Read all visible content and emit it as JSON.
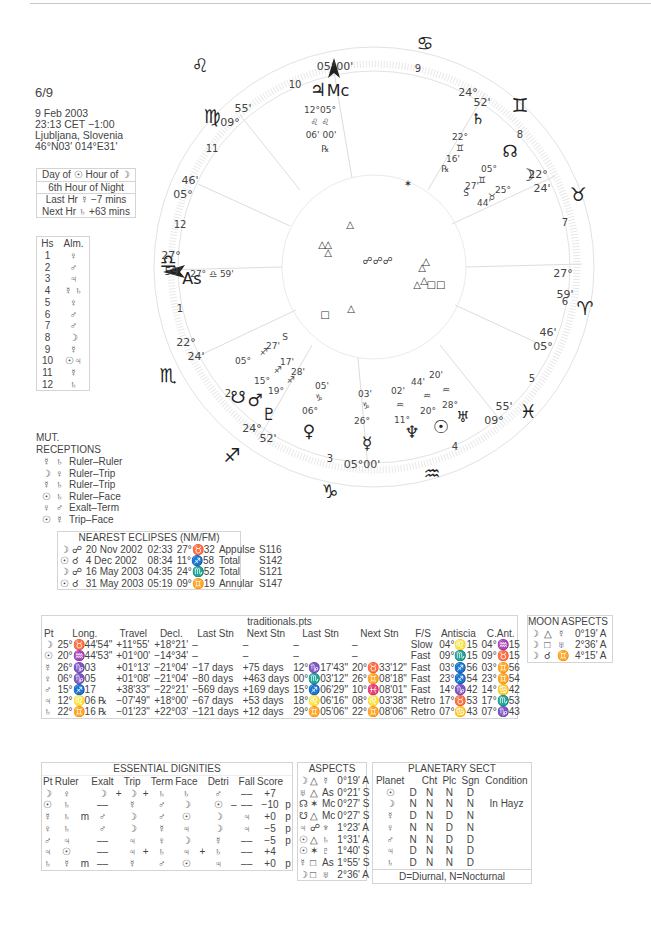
{
  "header": {
    "chart_id": "6/9",
    "date": "9 Feb 2003",
    "time": "23:13  CET −1:00",
    "place": "Ljubljana, Slovenia",
    "coords": "46°N03' 014°E31'"
  },
  "planetary_hours": {
    "line1": "Day of ☉  Hour of ☽",
    "line2": "6th Hour of Night",
    "line3": "Last Hr  ☿  −7 mins",
    "line4": "Next Hr  ♄  +63 mins"
  },
  "houses_almutens": {
    "headers": [
      "Hs",
      "Alm."
    ],
    "rows": [
      [
        "1",
        "♀"
      ],
      [
        "2",
        "♂"
      ],
      [
        "3",
        "♃"
      ],
      [
        "4",
        "☿ ♄"
      ],
      [
        "5",
        "♀"
      ],
      [
        "6",
        "♂"
      ],
      [
        "7",
        "♂"
      ],
      [
        "8",
        "☽"
      ],
      [
        "9",
        "☿"
      ],
      [
        "10",
        "☉♃"
      ],
      [
        "11",
        "☿"
      ],
      [
        "12",
        "♄"
      ]
    ]
  },
  "mutual_receptions": {
    "title": "MUT. RECEPTIONS",
    "rows": [
      {
        "p1": "☿",
        "p2": "♄",
        "type": "Ruler–Ruler"
      },
      {
        "p1": "☽",
        "p2": "♀",
        "type": "Ruler–Trip"
      },
      {
        "p1": "☿",
        "p2": "♄",
        "type": "Ruler–Trip"
      },
      {
        "p1": "☉",
        "p2": "♄",
        "type": "Ruler–Face"
      },
      {
        "p1": "♀",
        "p2": "♂",
        "type": "Exalt–Term"
      },
      {
        "p1": "☉",
        "p2": "☿",
        "type": "Trip–Face"
      }
    ]
  },
  "eclipses": {
    "title": "NEAREST ECLIPSES (NM/FM)",
    "rows": [
      [
        "☽ ☍",
        "20 Nov 2002",
        "02:33",
        "27°♉32",
        "Appulse",
        "S116"
      ],
      [
        "☉ ☌",
        "4 Dec 2002",
        "08:34",
        "11°♐58",
        "Total",
        "S142"
      ],
      [
        "☽ ☍",
        "16 May 2003",
        "04:35",
        "24°♏52",
        "Total",
        "S121"
      ],
      [
        "☉ ☌",
        "31 May 2003",
        "05:19",
        "09°♊19",
        "Annular",
        "S147"
      ]
    ]
  },
  "traditionals": {
    "title": "traditionals.pts",
    "headers": [
      "Pt",
      "Long.",
      "Travel",
      "Decl.",
      "Last Stn",
      "Next Stn",
      "Last Stn",
      "Next Stn",
      "F/S",
      "Antiscia",
      "C.Ant."
    ],
    "rows": [
      [
        "☽",
        "25°♉44'54\"",
        "+11°55'",
        "+18°21'",
        "–",
        "–",
        "–",
        "–",
        "Slow",
        "04°♌15",
        "04°♒15"
      ],
      [
        "☉",
        "20°♒44'53\"",
        "+01°00'",
        "−14°34'",
        "–",
        "–",
        "–",
        "–",
        "Fast",
        "09°♏15",
        "09°♉15"
      ],
      [
        "☿",
        "26°♑03",
        "+01°13'",
        "−21°04'",
        "−17 days",
        "+75 days",
        "12°♑17'43\"",
        "20°♉33'12\"",
        "Fast",
        "03°♐56",
        "03°♊56"
      ],
      [
        "♀",
        "06°♑05",
        "+01°08'",
        "−21°04'",
        "−80 days",
        "+463 days",
        "00°♏03'12\"",
        "26°♊08'18\"",
        "Fast",
        "23°♐54",
        "23°♊54"
      ],
      [
        "♂",
        "15°♐17",
        "+38'33\"",
        "−22°21'",
        "−569 days",
        "+169 days",
        "15°♐06'29\"",
        "10°♓08'01\"",
        "Fast",
        "14°♑42",
        "14°♋42"
      ],
      [
        "♃",
        "12°♌06 ℞",
        "−07'49\"",
        "+18°00'",
        "−67 days",
        "+53 days",
        "18°♌06'16\"",
        "08°♌03'38\"",
        "Retro",
        "17°♉53",
        "17°♏53"
      ],
      [
        "♄",
        "22°♊16 ℞",
        "−01'23\"",
        "+22°03'",
        "−121 days",
        "+12 days",
        "29°♊05'06\"",
        "22°♊08'06\"",
        "Retro",
        "07°♋43",
        "07°♑43"
      ]
    ]
  },
  "moon_aspects": {
    "title": "MOON ASPECTS",
    "rows": [
      [
        "☽",
        "△",
        "☿",
        "0°19' A"
      ],
      [
        "☽",
        "□",
        "♅",
        "2°36' A"
      ],
      [
        "☽",
        "☌",
        "♊",
        "4°15' A"
      ]
    ]
  },
  "essential_dignities": {
    "title": "ESSENTIAL DIGNITIES",
    "headers": [
      "Pt",
      "Ruler",
      "",
      "Exalt",
      "",
      "Trip",
      "",
      "Term",
      "Face",
      "",
      "Detri",
      "",
      "Fall",
      "Score",
      ""
    ],
    "rows": [
      [
        "☽",
        "♀",
        "",
        "☽",
        "+",
        "☽",
        "+",
        "♄",
        "♄",
        "",
        "♂",
        "",
        "––",
        "+7",
        ""
      ],
      [
        "☉",
        "♄",
        "",
        "––",
        "",
        "☿",
        "",
        "♂",
        "☽",
        "",
        "☉",
        "–",
        "––",
        "−10",
        "p"
      ],
      [
        "☿",
        "♄",
        "m",
        "♂",
        "",
        "☽",
        "",
        "♂",
        "☉",
        "",
        "☽",
        "",
        "♃",
        "+0",
        "p"
      ],
      [
        "♀",
        "♄",
        "",
        "♂",
        "",
        "☽",
        "",
        "☿",
        "♃",
        "",
        "☽",
        "",
        "♃",
        "−5",
        "p"
      ],
      [
        "♂",
        "♃",
        "",
        "––",
        "",
        "♃",
        "",
        "♀",
        "☽",
        "",
        "☿",
        "",
        "––",
        "−5",
        "p"
      ],
      [
        "♃",
        "☉",
        "",
        "––",
        "",
        "♃",
        "+",
        "♄",
        "♃",
        "+",
        "♄",
        "",
        "––",
        "+4",
        ""
      ],
      [
        "♄",
        "☿",
        "m",
        "––",
        "",
        "☿",
        "",
        "♂",
        "☉",
        "",
        "♃",
        "",
        "––",
        "+0",
        "p"
      ]
    ]
  },
  "aspects": {
    "title": "ASPECTS",
    "rows": [
      [
        "☽",
        "△",
        "☿",
        "0°19' A"
      ],
      [
        "♅",
        "△",
        "As",
        "0°21' S"
      ],
      [
        "☊",
        "✶",
        "Mc",
        "0°27' S"
      ],
      [
        "☋",
        "△",
        "Mc",
        "0°27' S"
      ],
      [
        "♃",
        "☍",
        "♆",
        "1°23' A"
      ],
      [
        "☉",
        "△",
        "♄",
        "1°31' A"
      ],
      [
        "☉",
        "✶",
        "♇",
        "1°40' S"
      ],
      [
        "☿",
        "□",
        "As",
        "1°55' S"
      ],
      [
        "☽",
        "□",
        "♅",
        "2°36' A"
      ]
    ]
  },
  "planetary_sect": {
    "title": "PLANETARY SECT",
    "headers": [
      "Planet",
      "",
      "Cht",
      "Plc",
      "Sgn",
      "Condition"
    ],
    "rows": [
      [
        "☉",
        "D",
        "N",
        "N",
        "D",
        ""
      ],
      [
        "☽",
        "N",
        "N",
        "N",
        "N",
        "In Hayz"
      ],
      [
        "☿",
        "D",
        "N",
        "D",
        "N",
        ""
      ],
      [
        "♀",
        "N",
        "N",
        "D",
        "N",
        ""
      ],
      [
        "♂",
        "N",
        "N",
        "D",
        "D",
        ""
      ],
      [
        "♃",
        "D",
        "N",
        "N",
        "D",
        ""
      ],
      [
        "♄",
        "D",
        "N",
        "N",
        "D",
        ""
      ]
    ],
    "footer": "D=Diurnal, N=Nocturnal"
  },
  "wheel": {
    "signs": [
      {
        "glyph": "♌",
        "x": 200,
        "y": 72
      },
      {
        "glyph": "♋",
        "x": 425,
        "y": 50
      },
      {
        "glyph": "♊",
        "x": 520,
        "y": 112
      },
      {
        "glyph": "♉",
        "x": 578,
        "y": 201
      },
      {
        "glyph": "♈",
        "x": 585,
        "y": 315
      },
      {
        "glyph": "♓",
        "x": 528,
        "y": 418
      },
      {
        "glyph": "♒",
        "x": 432,
        "y": 480
      },
      {
        "glyph": "♑",
        "x": 330,
        "y": 498
      },
      {
        "glyph": "♐",
        "x": 232,
        "y": 462
      },
      {
        "glyph": "♏",
        "x": 168,
        "y": 382
      },
      {
        "glyph": "♎",
        "x": 168,
        "y": 268
      },
      {
        "glyph": "♍",
        "x": 212,
        "y": 123
      }
    ],
    "house_numbers": [
      {
        "n": "1",
        "x": 180,
        "y": 312
      },
      {
        "n": "2",
        "x": 228,
        "y": 397
      },
      {
        "n": "3",
        "x": 330,
        "y": 462
      },
      {
        "n": "4",
        "x": 455,
        "y": 450
      },
      {
        "n": "5",
        "x": 532,
        "y": 382
      },
      {
        "n": "6",
        "x": 565,
        "y": 305
      },
      {
        "n": "7",
        "x": 565,
        "y": 226
      },
      {
        "n": "8",
        "x": 520,
        "y": 138
      },
      {
        "n": "9",
        "x": 418,
        "y": 72
      },
      {
        "n": "10",
        "x": 295,
        "y": 88
      },
      {
        "n": "11",
        "x": 212,
        "y": 152
      },
      {
        "n": "12",
        "x": 180,
        "y": 228
      }
    ],
    "cusp_labels": [
      {
        "t": "05°00'",
        "x": 335,
        "y": 70
      },
      {
        "t": "24°",
        "x": 468,
        "y": 96
      },
      {
        "t": "52'",
        "x": 482,
        "y": 106
      },
      {
        "t": "22°",
        "x": 538,
        "y": 178
      },
      {
        "t": "24'",
        "x": 542,
        "y": 192
      },
      {
        "t": "27°",
        "x": 563,
        "y": 277
      },
      {
        "t": "59'",
        "x": 565,
        "y": 298
      },
      {
        "t": "46'",
        "x": 548,
        "y": 336
      },
      {
        "t": "05°",
        "x": 543,
        "y": 350
      },
      {
        "t": "55'",
        "x": 504,
        "y": 410
      },
      {
        "t": "09°",
        "x": 494,
        "y": 424
      },
      {
        "t": "05°00'",
        "x": 362,
        "y": 468
      },
      {
        "t": "24°",
        "x": 252,
        "y": 432
      },
      {
        "t": "52'",
        "x": 268,
        "y": 442
      },
      {
        "t": "22°",
        "x": 186,
        "y": 346
      },
      {
        "t": "24'",
        "x": 196,
        "y": 360
      },
      {
        "t": "27°",
        "x": 171,
        "y": 259
      },
      {
        "t": "59'",
        "x": 173,
        "y": 275
      },
      {
        "t": "46'",
        "x": 190,
        "y": 184
      },
      {
        "t": "05°",
        "x": 183,
        "y": 198
      },
      {
        "t": "55'",
        "x": 243,
        "y": 112
      },
      {
        "t": "09°",
        "x": 230,
        "y": 126
      }
    ],
    "planets": [
      {
        "glyph": "♃",
        "x": 318,
        "y": 96,
        "size": 18
      },
      {
        "glyph": "Mc",
        "x": 338,
        "y": 96,
        "size": 16
      },
      {
        "glyph": "♄",
        "x": 478,
        "y": 124,
        "size": 15
      },
      {
        "glyph": "☊",
        "x": 510,
        "y": 157,
        "size": 17
      },
      {
        "glyph": "☽",
        "x": 527,
        "y": 181,
        "size": 17
      },
      {
        "glyph": "As",
        "x": 192,
        "y": 284,
        "size": 16
      },
      {
        "glyph": "☋",
        "x": 238,
        "y": 403,
        "size": 17
      },
      {
        "glyph": "♂",
        "x": 255,
        "y": 406,
        "size": 17
      },
      {
        "glyph": "♇",
        "x": 269,
        "y": 420,
        "size": 17
      },
      {
        "glyph": "♀",
        "x": 309,
        "y": 437,
        "size": 17
      },
      {
        "glyph": "☿",
        "x": 367,
        "y": 449,
        "size": 17
      },
      {
        "glyph": "♆",
        "x": 412,
        "y": 438,
        "size": 17
      },
      {
        "glyph": "☉",
        "x": 441,
        "y": 433,
        "size": 18
      },
      {
        "glyph": "♅",
        "x": 463,
        "y": 422,
        "size": 15
      }
    ],
    "planet_labels": [
      {
        "t": "12°05°",
        "x": 320,
        "y": 113
      },
      {
        "t": "♌ ♌",
        "x": 320,
        "y": 125
      },
      {
        "t": "06' 00'",
        "x": 321,
        "y": 138
      },
      {
        "t": "℞",
        "x": 325,
        "y": 152
      },
      {
        "t": "22°",
        "x": 460,
        "y": 140
      },
      {
        "t": "♊",
        "x": 460,
        "y": 151
      },
      {
        "t": "16'",
        "x": 453,
        "y": 162
      },
      {
        "t": "℞",
        "x": 445,
        "y": 172
      },
      {
        "t": "05°",
        "x": 489,
        "y": 172
      },
      {
        "t": "♊",
        "x": 482,
        "y": 183
      },
      {
        "t": "27'",
        "x": 472,
        "y": 189
      },
      {
        "t": "S",
        "x": 466,
        "y": 196
      },
      {
        "t": "25°",
        "x": 503,
        "y": 193
      },
      {
        "t": "♉",
        "x": 492,
        "y": 200
      },
      {
        "t": "44'",
        "x": 484,
        "y": 206
      },
      {
        "t": "27° ♎ 59'",
        "x": 212,
        "y": 277
      },
      {
        "t": "S",
        "x": 285,
        "y": 340
      },
      {
        "t": "27'",
        "x": 273,
        "y": 349
      },
      {
        "t": "♐",
        "x": 264,
        "y": 355
      },
      {
        "t": "05°",
        "x": 243,
        "y": 364
      },
      {
        "t": "17'",
        "x": 287,
        "y": 365
      },
      {
        "t": "♐",
        "x": 278,
        "y": 373
      },
      {
        "t": "15°",
        "x": 262,
        "y": 384
      },
      {
        "t": "28'",
        "x": 298,
        "y": 375
      },
      {
        "t": "♐",
        "x": 291,
        "y": 383
      },
      {
        "t": "19°",
        "x": 276,
        "y": 394
      },
      {
        "t": "05'",
        "x": 322,
        "y": 389
      },
      {
        "t": "♑",
        "x": 319,
        "y": 401
      },
      {
        "t": "06°",
        "x": 310,
        "y": 414
      },
      {
        "t": "03'",
        "x": 365,
        "y": 397
      },
      {
        "t": "♑",
        "x": 366,
        "y": 409
      },
      {
        "t": "26°",
        "x": 362,
        "y": 424
      },
      {
        "t": "02'",
        "x": 398,
        "y": 394
      },
      {
        "t": "♒",
        "x": 400,
        "y": 408
      },
      {
        "t": "11°",
        "x": 402,
        "y": 423
      },
      {
        "t": "44'",
        "x": 418,
        "y": 385
      },
      {
        "t": "♒",
        "x": 427,
        "y": 399
      },
      {
        "t": "20°",
        "x": 428,
        "y": 414
      },
      {
        "t": "20'",
        "x": 436,
        "y": 378
      },
      {
        "t": "♒",
        "x": 446,
        "y": 393
      },
      {
        "t": "28°",
        "x": 450,
        "y": 408
      }
    ],
    "aspect_glyphs": [
      {
        "g": "△",
        "x": 350,
        "y": 228
      },
      {
        "g": "△",
        "x": 322,
        "y": 248
      },
      {
        "g": "△",
        "x": 328,
        "y": 248
      },
      {
        "g": "△",
        "x": 328,
        "y": 256
      },
      {
        "g": "☍☍☍",
        "x": 378,
        "y": 264
      },
      {
        "g": "△",
        "x": 422,
        "y": 271
      },
      {
        "g": "△",
        "x": 426,
        "y": 265
      },
      {
        "g": "△",
        "x": 417,
        "y": 288
      },
      {
        "g": "△",
        "x": 424,
        "y": 284
      },
      {
        "g": "□□",
        "x": 436,
        "y": 288
      },
      {
        "g": "□",
        "x": 325,
        "y": 318
      },
      {
        "g": "△",
        "x": 351,
        "y": 312
      },
      {
        "g": "✶",
        "x": 408,
        "y": 187
      }
    ]
  }
}
